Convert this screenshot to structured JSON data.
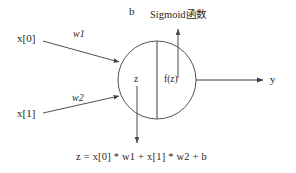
{
  "diagram": {
    "title_label": "b",
    "activation_label": "Sigmoid函数",
    "inputs": [
      {
        "name": "x[0]",
        "weight": "w1"
      },
      {
        "name": "x[1]",
        "weight": "w2"
      }
    ],
    "neuron": {
      "pre_activation_label": "z",
      "activation_output_label": "f(z)"
    },
    "output_label": "y",
    "equation": "z = x[0] * w1 + x[1] * w2 + b",
    "colors": {
      "stroke": "#3d3d3d",
      "text": "#262626",
      "background": "#ffffff"
    }
  }
}
